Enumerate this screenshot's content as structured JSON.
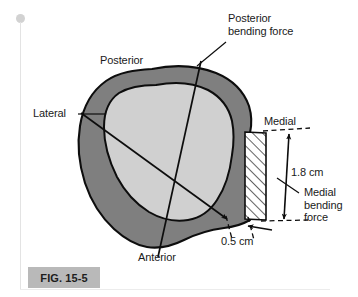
{
  "figure": {
    "caption": "FIG. 15-5"
  },
  "labels": {
    "posterior_bending_force": "Posterior\nbending force",
    "posterior": "Posterior",
    "lateral": "Lateral",
    "medial": "Medial",
    "anterior": "Anterior",
    "medial_bending_force": "Medial\nbending\nforce",
    "dim_vertical": "1.8 cm",
    "dim_horizontal": "0.5 cm"
  },
  "measurements": {
    "cortical_thickness_vertical": "1.8 cm",
    "cortical_thickness_horizontal": "0.5 cm"
  },
  "colors": {
    "cortical_bone": "#7f7f7f",
    "medullary_cavity": "#d0d0d0",
    "outline": "#0d0d0d",
    "hatch_fill": "#ffffff",
    "caption_bar": "#b9b9b9",
    "text": "#1a1a1a",
    "page_rule": "#e3e3e3"
  },
  "icons": {
    "page_marker": "page-marker-dot"
  }
}
